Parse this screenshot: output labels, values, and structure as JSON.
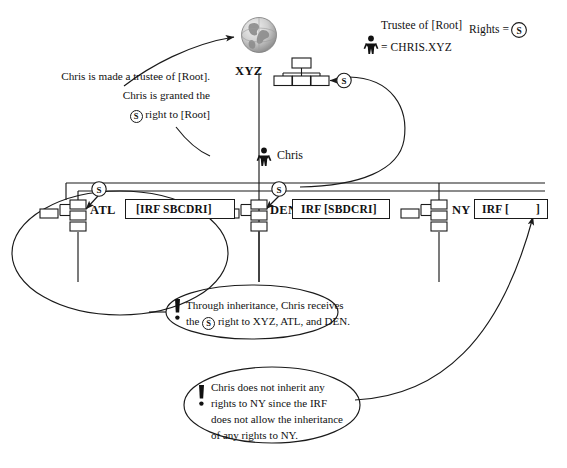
{
  "diagram": {
    "title_nodes": {
      "root_label": "XYZ",
      "atl_label": "ATL",
      "den_label": "DEN",
      "ny_label": "NY",
      "chris_label": "Chris"
    },
    "irf_boxes": {
      "atl": "[IRF SBCDRI]",
      "den": "IRF [SBDCRI]",
      "ny_prefix": "IRF [",
      "ny_suffix": "]"
    },
    "legend": {
      "trustee_line": "Trustee of [Root]",
      "person_equals": "= CHRIS.XYZ",
      "rights_label": "Rights =",
      "rights_symbol": "S"
    },
    "left_note": {
      "line1": "Chris is made a trustee of [Root].",
      "line2": "Chris is granted the",
      "line3_symbol": "S",
      "line3_rest": "right to [Root]"
    },
    "callout_one": {
      "line1": "Through inheritance, Chris receives",
      "line2_pre": "the",
      "line2_symbol": "S",
      "line2_post": "right to XYZ, ATL, and DEN."
    },
    "callout_two": {
      "line1": "Chris does not inherit any",
      "line2": "rights to NY since the IRF",
      "line3": "does not allow the inheritance",
      "line4": "of any rights to NY."
    },
    "rights_badges": {
      "root_badge": "S",
      "atl_badge": "S",
      "den_badge": "S"
    },
    "colors": {
      "line": "#1a1a1a",
      "text": "#111111",
      "background": "#ffffff",
      "globe_light": "#d8d8d8",
      "globe_dark": "#8a8a8a",
      "icon_fill": "#ffffff"
    }
  }
}
